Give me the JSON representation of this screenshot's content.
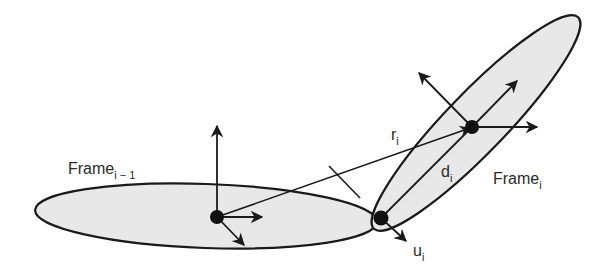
{
  "diagram": {
    "colors": {
      "stroke": "#1a1a1a",
      "fill": "#e8e8e8",
      "background": "#ffffff",
      "text": "#2a2a2a"
    },
    "frames": [
      {
        "id": "frame_prev",
        "label": "Frame",
        "subscript": "i − 1",
        "origin": [
          217,
          217
        ]
      },
      {
        "id": "frame_cur",
        "label": "Frame",
        "subscript": "i",
        "origin": [
          472,
          127
        ]
      }
    ],
    "vectors": [
      {
        "id": "r",
        "label": "r",
        "subscript": "i",
        "from": "frame_prev origin",
        "to": "frame_cur origin"
      },
      {
        "id": "d",
        "label": "d",
        "subscript": "i",
        "from": "joint",
        "to": "frame_cur origin"
      },
      {
        "id": "u",
        "label": "u",
        "subscript": "i",
        "from": "joint",
        "direction": "joint axis"
      }
    ],
    "joint": {
      "position": [
        381,
        218
      ]
    }
  }
}
